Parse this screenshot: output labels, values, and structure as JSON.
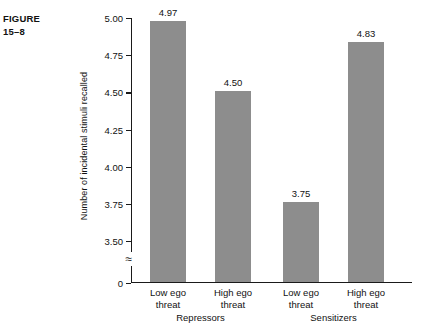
{
  "figure": {
    "label_line1": "FIGURE",
    "label_line2": "15–8"
  },
  "chart_data": {
    "type": "bar",
    "title": "",
    "xlabel": "",
    "ylabel": "Number of incidental stimuli recalled",
    "ylim": [
      3.4,
      5.0
    ],
    "y_axis_break": true,
    "y_axis_break_symbol": "≈",
    "grid": false,
    "legend": "none",
    "bar_color": "#8d8d8d",
    "axis_color": "#1a1a1a",
    "yticks": [
      "5.00",
      "4.75",
      "4.50",
      "4.25",
      "4.00",
      "3.75",
      "3.50",
      "0"
    ],
    "ytick_values": [
      5.0,
      4.75,
      4.5,
      4.25,
      4.0,
      3.75,
      3.5,
      0
    ],
    "categories": [
      "Low ego threat",
      "High ego threat",
      "Low ego threat",
      "High ego threat"
    ],
    "category_lines": [
      [
        "Low ego",
        "threat"
      ],
      [
        "High ego",
        "threat"
      ],
      [
        "Low ego",
        "threat"
      ],
      [
        "High ego",
        "threat"
      ]
    ],
    "values": [
      4.97,
      4.5,
      3.75,
      4.83
    ],
    "value_labels": [
      "4.97",
      "4.50",
      "3.75",
      "4.83"
    ],
    "groups": [
      {
        "name": "Repressors",
        "categories": [
          "Low ego threat",
          "High ego threat"
        ],
        "values": [
          4.97,
          4.5
        ]
      },
      {
        "name": "Sensitizers",
        "categories": [
          "Low ego threat",
          "High ego threat"
        ],
        "values": [
          3.75,
          4.83
        ]
      }
    ],
    "group_labels": [
      "Repressors",
      "Sensitizers"
    ]
  }
}
